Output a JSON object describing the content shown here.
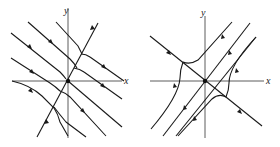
{
  "figure": {
    "panels": [
      {
        "id": "left",
        "description": "Phase portrait: family of parallel trajectories (slope -1) bending onto a steep line through the origin",
        "axes": {
          "x_label": "x",
          "y_label": "y"
        },
        "equilibrium": "origin"
      },
      {
        "id": "right",
        "description": "Saddle phase portrait: stable line along y = -x, trajectories parallel to y = x",
        "axes": {
          "x_label": "x",
          "y_label": "y"
        },
        "equilibrium": "origin"
      }
    ]
  }
}
